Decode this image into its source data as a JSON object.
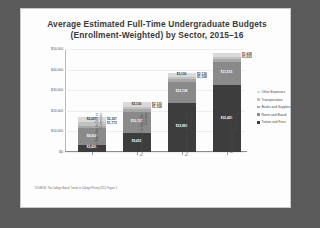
{
  "slide": {
    "title_line1": "Average Estimated Full-Time Undergraduate Budgets",
    "title_line2": "(Enrollment-Weighted) by Sector, 2015–16",
    "source_note": "SOURCE: The College Board, Trends in College Pricing 2015, Figure 1."
  },
  "legend": {
    "items": [
      {
        "label": "Other Expenses",
        "color": "#d9d9d9"
      },
      {
        "label": "Transportation",
        "color": "#c2c2c2"
      },
      {
        "label": "Books and Supplies",
        "color": "#a8a8a8"
      },
      {
        "label": "Room and Board",
        "color": "#8a8a8a"
      },
      {
        "label": "Tuition and Fees",
        "color": "#3d3d3d"
      }
    ]
  },
  "chart_data": {
    "type": "bar",
    "stacked": true,
    "title": "Average Estimated Full-Time Undergraduate Budgets (Enrollment-Weighted) by Sector, 2015–16",
    "xlabel": "",
    "ylabel": "",
    "ylim": [
      0,
      50000
    ],
    "yticks": [
      0,
      10000,
      20000,
      30000,
      40000,
      50000
    ],
    "ytick_labels": [
      "$0",
      "$10,000",
      "$20,000",
      "$30,000",
      "$40,000",
      "$50,000"
    ],
    "grid": true,
    "legend_position": "right",
    "categories": [
      "Public Two-Year In-District Commuter",
      "Public Four-Year In-State On-Campus",
      "Public Four-Year Out-of-State On-Campus",
      "Private Nonprofit Four-Year On-Campus"
    ],
    "series": [
      {
        "name": "Tuition and Fees",
        "color": "#3d3d3d",
        "values": [
          3435,
          9410,
          23893,
          32405
        ],
        "labels": [
          "$3,435",
          "$9,410",
          "$23,893",
          "$32,405"
        ],
        "label_color": "#ffffff"
      },
      {
        "name": "Room and Board",
        "color": "#8a8a8a",
        "values": [
          8003,
          10138,
          10138,
          11516
        ],
        "labels": [
          "$8,003",
          "$10,138",
          "$10,138",
          "$11,516"
        ],
        "label_color": "#ffffff"
      },
      {
        "name": "Books and Supplies",
        "color": "#a8a8a8",
        "values": [
          1364,
          1298,
          1298,
          1249
        ],
        "labels": [
          "$1,364",
          "$1,298",
          "$1,298",
          "$1,249"
        ],
        "label_color": "#303030"
      },
      {
        "name": "Transportation",
        "color": "#c2c2c2",
        "values": [
          1773,
          1108,
          1108,
          1033
        ],
        "labels": [
          "$1,773",
          "$1,108",
          "$1,108",
          "$1,033"
        ],
        "label_color": "#303030"
      },
      {
        "name": "Other Expenses",
        "color": "#d9d9d9",
        "values": [
          2207,
          2130,
          2130,
          1628
        ],
        "labels": [
          "$2,207",
          "$2,130",
          "$2,130",
          "$1,628"
        ],
        "label_color": "#303030"
      }
    ],
    "totals": [
      16782,
      24084,
      38567,
      47831
    ]
  }
}
